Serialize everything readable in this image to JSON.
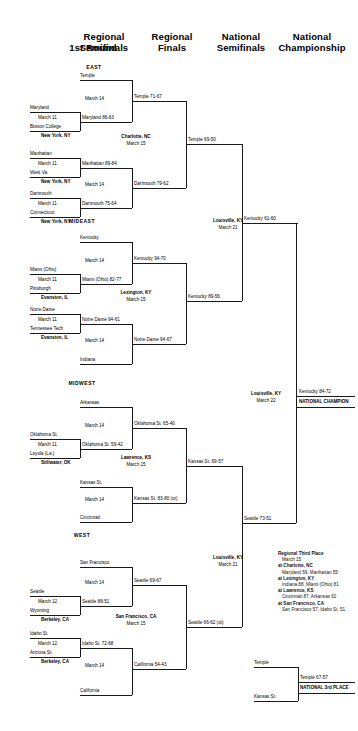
{
  "headers": [
    {
      "label": "1st Round"
    },
    {
      "label": "Regional\nSemifinals"
    },
    {
      "label": "Regional\nFinals"
    },
    {
      "label": "National\nSemifinals"
    },
    {
      "label": "National\nChampionship"
    }
  ],
  "header_lines": {
    "r1": "1st Round",
    "r2a": "Regional",
    "r2b": "Semifinals",
    "r3a": "Regional",
    "r3b": "Finals",
    "r4a": "National",
    "r4b": "Semifinals",
    "r5a": "National",
    "r5b": "Championship"
  },
  "regions": {
    "east": "EAST",
    "mideast": "MIDEAST",
    "midwest": "MIDWEST",
    "west": "WEST"
  },
  "east": {
    "bye_top": "Temple",
    "g1_team1": "Maryland",
    "g1_date": "March 11",
    "g1_team2": "Boston College",
    "g1_site": "New York, NY",
    "g1_result": "Maryland 86-63",
    "semi1_date": "March 14",
    "semi1_result": "Temple 71-67",
    "g2_team1": "Manhattan",
    "g2_date": "March 11",
    "g2_team2": "West Va.",
    "g2_site": "New York, NY",
    "g2_result": "Manhattan 89-84",
    "g3_team1": "Dartmouth",
    "g3_date": "March 11",
    "g3_team2": "Connecticut",
    "g3_site": "New York, NY",
    "g3_result": "Dartmouth 75-64",
    "semi2_date": "March 14",
    "semi2_result": "Dartmouth 79-62",
    "final_site": "Charlotte, NC",
    "final_date": "March 15",
    "final_result": "Temple 69-50"
  },
  "mideast": {
    "bye_top": "Kentucky",
    "semi1_date": "March 14",
    "semi1_result": "Kentucky 94-70",
    "g1_team1": "Miami (Ohio)",
    "g1_date": "March 11",
    "g1_team2": "Pittsburgh",
    "g1_site": "Evanston, IL",
    "g1_result": "Miami (Ohio) 82-77",
    "g2_team1": "Notre Dame",
    "g2_date": "March 11",
    "g2_team2": "Tennessee Tech",
    "g2_site": "Evanston, IL",
    "g2_result": "Notre Dame 94-61",
    "semi2_date": "March 14",
    "semi2_result": "Notre Dame 94-67",
    "bye_bottom": "Indiana",
    "final_site": "Lexington, KY",
    "final_date": "March 15",
    "final_result": "Kentucky 89-56"
  },
  "midwest": {
    "bye_top": "Arkansas",
    "semi1_date": "March 14",
    "semi1_result": "Oklahoma St. 65-40",
    "g1_team1": "Oklahoma St.",
    "g1_date": "March 11",
    "g1_team2": "Loyola (La.)",
    "g1_site": "Stillwater, OK",
    "g1_result": "Oklahoma St. 59-42",
    "bye_mid": "Kansas St.",
    "semi2_date": "March 14",
    "semi2_result": "Kansas St. 83-80 (ot)",
    "bye_bottom": "Cincinnati",
    "final_site": "Lawrence, KS",
    "final_date": "March 15",
    "final_result": "Kansas St. 69-57"
  },
  "west": {
    "bye_top": "San Francisco",
    "semi1_date": "March 14",
    "semi1_result": "Seattle 69-67",
    "g1_team1": "Seattle",
    "g1_date": "March 12",
    "g1_team2": "Wyoming",
    "g1_site": "Berkeley, CA",
    "g1_result": "Seattle 88-51",
    "g2_team1": "Idaho St.",
    "g2_date": "March 12",
    "g2_team2": "Arizona St.",
    "g2_site": "Berkeley, CA",
    "g2_result": "Idaho St. 72-68",
    "semi2_date": "March 14",
    "semi2_result": "California 54-43",
    "bye_bottom": "California",
    "final_site": "San Francisco, CA",
    "final_date": "March 15",
    "final_result": "Seattle 66-62 (ot)"
  },
  "national": {
    "semi_top_site": "Louisville, KY",
    "semi_top_date": "March 21",
    "semi_top_result": "Kentucky 61-60",
    "semi_bottom_site": "Louisville, KY",
    "semi_bottom_date": "March 21",
    "semi_bottom_result": "Seattle 73-51",
    "final_site": "Louisville, KY",
    "final_date": "March 22",
    "final_result": "Kentucky 84-72",
    "champion_label": "NATIONAL CHAMPION"
  },
  "third_place": {
    "title": "Regional Third Place",
    "date": "March 15",
    "entries": [
      {
        "site": "at Charlotte, NC",
        "score": "Maryland 59, Manhattan 55"
      },
      {
        "site": "at Lexington, KY",
        "score": "Indiana 88, Miami (Ohio) 81"
      },
      {
        "site": "at Lawrence, KS",
        "score": "Cincinnati 87, Arkansas 62"
      },
      {
        "site": "at San Francisco, CA",
        "score": "San Francisco 57, Idaho St. 51"
      }
    ]
  },
  "third_national": {
    "team_top": "Temple",
    "result": "Temple 67-57",
    "team_bottom": "Kansas St.",
    "label": "NATIONAL 3rd PLACE"
  }
}
